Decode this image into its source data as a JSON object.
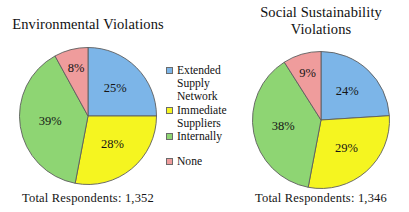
{
  "figure": {
    "background": "#ffffff",
    "charts": [
      {
        "id": "environmental",
        "title_lines": [
          "Environmental Violations"
        ],
        "total_label": "Total Respondents: 1,352"
      },
      {
        "id": "social",
        "title_lines": [
          "Social Sustainability",
          "Violations"
        ],
        "total_label": "Total Respondents: 1,346"
      }
    ]
  },
  "legend": {
    "items": [
      {
        "label": "Extended Supply Network",
        "color": "#7cb5e8"
      },
      {
        "label": "Immediate Suppliers",
        "color": "#f5f520"
      },
      {
        "label": "Internally",
        "color": "#8ed573"
      },
      {
        "label": "None",
        "color": "#ef9c9c"
      }
    ]
  },
  "chart_data": [
    {
      "type": "pie",
      "title": "Environmental Violations",
      "labels": [
        "Extended Supply Network",
        "Immediate Suppliers",
        "Internally",
        "None"
      ],
      "values": [
        25,
        28,
        39,
        8
      ],
      "value_labels": [
        "25%",
        "28%",
        "39%",
        "8%"
      ],
      "colors": [
        "#7cb5e8",
        "#f5f520",
        "#8ed573",
        "#ef9c9c"
      ],
      "units": "percent",
      "start_angle_deg": 0,
      "direction": "clockwise",
      "total_respondents": "1,352",
      "annotation": "Total Respondents: 1,352",
      "legend_position": "center-right",
      "grid": false
    },
    {
      "type": "pie",
      "title": "Social Sustainability Violations",
      "labels": [
        "Extended Supply Network",
        "Immediate Suppliers",
        "Internally",
        "None"
      ],
      "values": [
        24,
        29,
        38,
        9
      ],
      "value_labels": [
        "24%",
        "29%",
        "38%",
        "9%"
      ],
      "colors": [
        "#7cb5e8",
        "#f5f520",
        "#8ed573",
        "#ef9c9c"
      ],
      "units": "percent",
      "start_angle_deg": 0,
      "direction": "clockwise",
      "total_respondents": "1,346",
      "annotation": "Total Respondents: 1,346",
      "legend_position": "center-left",
      "grid": false
    }
  ]
}
